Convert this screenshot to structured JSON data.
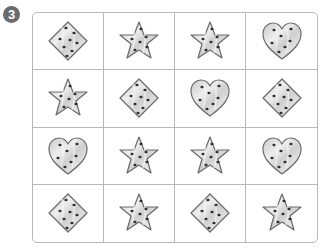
{
  "problem": {
    "number": "3"
  },
  "colors": {
    "fill": "#d4d4d4",
    "fill_light": "#ececec",
    "outline": "#6a6a6a",
    "chip": "#2e2e2e",
    "grid_line": "#b8b8b8"
  },
  "grid": {
    "rows": [
      [
        "diamond",
        "star",
        "star",
        "heart"
      ],
      [
        "star",
        "diamond",
        "heart",
        "diamond"
      ],
      [
        "heart",
        "star",
        "star",
        "heart"
      ],
      [
        "diamond",
        "star",
        "diamond",
        "star"
      ]
    ]
  }
}
